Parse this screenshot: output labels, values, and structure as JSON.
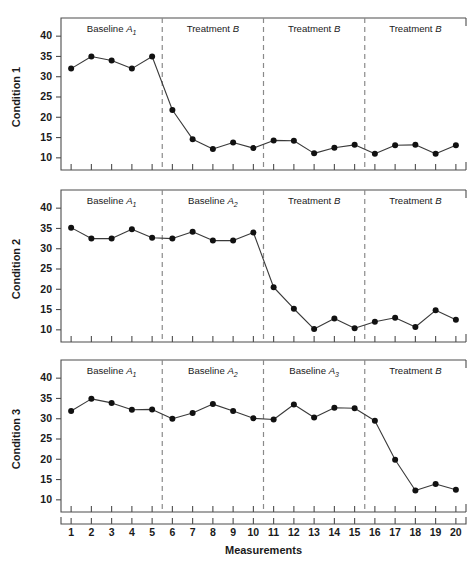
{
  "figure": {
    "xlabel": "Measurements",
    "background": "#ffffff",
    "line_color": "#3a3a3a",
    "point_color": "#111111",
    "phase_line_color": "#8a8a8a",
    "axis_color": "#4d4d4d"
  },
  "chart_data": {
    "type": "line",
    "title": "",
    "xlabel": "Measurements",
    "ylabel": "",
    "xlim": [
      0.5,
      20.5
    ],
    "ylim": [
      7,
      43
    ],
    "grid": false,
    "legend": "none",
    "x": [
      1,
      2,
      3,
      4,
      5,
      6,
      7,
      8,
      9,
      10,
      11,
      12,
      13,
      14,
      15,
      16,
      17,
      18,
      19,
      20
    ],
    "xtick_labels": [
      "1",
      "2",
      "3",
      "4",
      "5",
      "6",
      "7",
      "8",
      "9",
      "10",
      "11",
      "12",
      "13",
      "14",
      "15",
      "16",
      "17",
      "18",
      "19",
      "20"
    ],
    "ytick_labels": [
      "10",
      "15",
      "20",
      "25",
      "30",
      "35",
      "40"
    ],
    "yticks": [
      10,
      15,
      20,
      25,
      30,
      35,
      40
    ],
    "panels": [
      {
        "ylabel": "Condition 1",
        "values": [
          32.0,
          35.0,
          34.0,
          32.0,
          35.0,
          21.8,
          14.6,
          12.2,
          13.8,
          12.4,
          14.3,
          14.2,
          11.1,
          12.5,
          13.2,
          11.0,
          13.1,
          13.2,
          11.0,
          13.1
        ],
        "phase_breaks": [
          5.5,
          10.5,
          15.5
        ],
        "phases": [
          {
            "label": "Baseline",
            "symbol": "A",
            "subscript": "1",
            "start": 1,
            "end": 5
          },
          {
            "label": "Treatment",
            "symbol": "B",
            "subscript": "",
            "start": 6,
            "end": 10
          },
          {
            "label": "Treatment",
            "symbol": "B",
            "subscript": "",
            "start": 11,
            "end": 15
          },
          {
            "label": "Treatment",
            "symbol": "B",
            "subscript": "",
            "start": 16,
            "end": 20
          }
        ]
      },
      {
        "ylabel": "Condition 2",
        "values": [
          35.2,
          32.5,
          32.5,
          34.8,
          32.7,
          32.5,
          34.2,
          32.0,
          32.0,
          34.0,
          20.5,
          15.2,
          10.2,
          12.8,
          10.4,
          12.0,
          13.0,
          10.7,
          14.8,
          12.5
        ],
        "phase_breaks": [
          5.5,
          10.5,
          15.5
        ],
        "phases": [
          {
            "label": "Baseline",
            "symbol": "A",
            "subscript": "1",
            "start": 1,
            "end": 5
          },
          {
            "label": "Baseline",
            "symbol": "A",
            "subscript": "2",
            "start": 6,
            "end": 10
          },
          {
            "label": "Treatment",
            "symbol": "B",
            "subscript": "",
            "start": 11,
            "end": 15
          },
          {
            "label": "Treatment",
            "symbol": "B",
            "subscript": "",
            "start": 16,
            "end": 20
          }
        ]
      },
      {
        "ylabel": "Condition 3",
        "values": [
          31.9,
          34.9,
          33.9,
          32.2,
          32.3,
          30.0,
          31.4,
          33.6,
          31.9,
          30.1,
          29.8,
          33.5,
          30.3,
          32.7,
          32.6,
          29.5,
          19.9,
          12.3,
          13.9,
          12.5
        ],
        "phase_breaks": [
          5.5,
          10.5,
          15.5
        ],
        "phases": [
          {
            "label": "Baseline",
            "symbol": "A",
            "subscript": "1",
            "start": 1,
            "end": 5
          },
          {
            "label": "Baseline",
            "symbol": "A",
            "subscript": "2",
            "start": 6,
            "end": 10
          },
          {
            "label": "Baseline",
            "symbol": "A",
            "subscript": "3",
            "start": 11,
            "end": 15
          },
          {
            "label": "Treatment",
            "symbol": "B",
            "subscript": "",
            "start": 16,
            "end": 20
          }
        ]
      }
    ]
  }
}
